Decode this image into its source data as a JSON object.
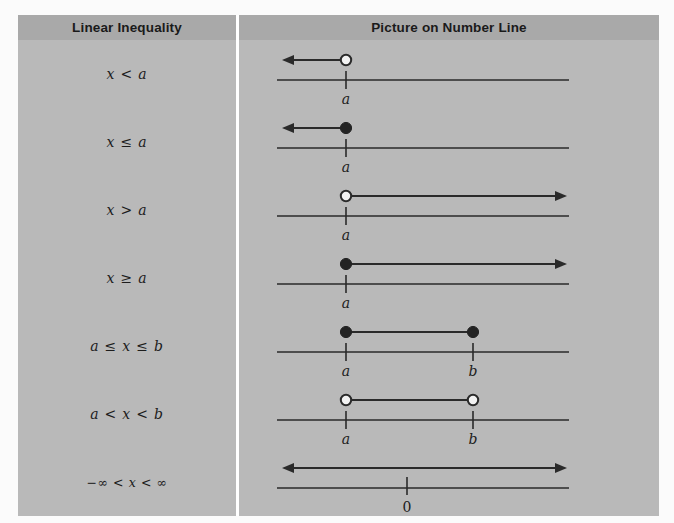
{
  "table": {
    "headers": {
      "left": "Linear Inequality",
      "right": "Picture on Number Line"
    },
    "colors": {
      "header_bg": "#a9a9a9",
      "cell_bg": "#b9b9b9",
      "divider": "#ffffff",
      "ink": "#2a2a2a",
      "page_bg": "#fbfbfb"
    },
    "rows": [
      {
        "id": "x-lt-a",
        "inequality": "x < a",
        "picture": {
          "type": "ray-left",
          "endpoint_style": "open",
          "endpoint_label": "a",
          "direction": "left",
          "arrowhead": "left"
        }
      },
      {
        "id": "x-le-a",
        "inequality": "x ≤ a",
        "picture": {
          "type": "ray-left",
          "endpoint_style": "closed",
          "endpoint_label": "a",
          "direction": "left",
          "arrowhead": "left"
        }
      },
      {
        "id": "x-gt-a",
        "inequality": "x > a",
        "picture": {
          "type": "ray-right",
          "endpoint_style": "open",
          "endpoint_label": "a",
          "direction": "right",
          "arrowhead": "right"
        }
      },
      {
        "id": "x-ge-a",
        "inequality": "x ≥ a",
        "picture": {
          "type": "ray-right",
          "endpoint_style": "closed",
          "endpoint_label": "a",
          "direction": "right",
          "arrowhead": "right"
        }
      },
      {
        "id": "a-le-x-le-b",
        "inequality": "a ≤ x ≤ b",
        "picture": {
          "type": "segment",
          "endpoint_style": "closed",
          "left_label": "a",
          "right_label": "b",
          "arrowhead": "none"
        }
      },
      {
        "id": "a-lt-x-lt-b",
        "inequality": "a < x < b",
        "picture": {
          "type": "segment",
          "endpoint_style": "open",
          "left_label": "a",
          "right_label": "b",
          "arrowhead": "none"
        }
      },
      {
        "id": "neg-inf-lt-x-lt-inf",
        "inequality": "−∞ < x < ∞",
        "picture": {
          "type": "full-line",
          "endpoint_style": "none",
          "endpoint_label": "0",
          "arrowhead": "both"
        }
      }
    ]
  },
  "geometry": {
    "axis_x_start": 38,
    "axis_x_end": 330,
    "axis_y": 40,
    "mark_a_x": 107,
    "mark_b_x": 234,
    "overlay_y": 20,
    "arrow_left_tip": 43,
    "arrow_right_tip": 328
  }
}
